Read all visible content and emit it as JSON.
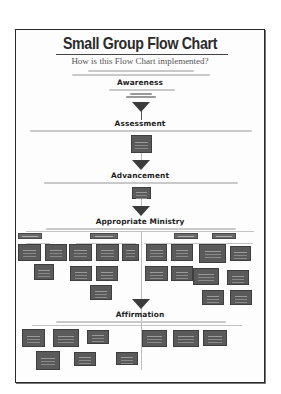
{
  "poster": {
    "title": "Small Group Flow Chart",
    "subtitle": "How is this Flow Chart implemented?",
    "stages": [
      {
        "label": "Awareness"
      },
      {
        "label": "Assessment"
      },
      {
        "label": "Advancement"
      },
      {
        "label": "Appropriate Ministry"
      },
      {
        "label": "Affirmation"
      }
    ]
  },
  "colors": {
    "box_fill": "#5a5a5a",
    "border": "#2a2a2a",
    "title": "#2b2b2b",
    "background": "#ffffff"
  }
}
